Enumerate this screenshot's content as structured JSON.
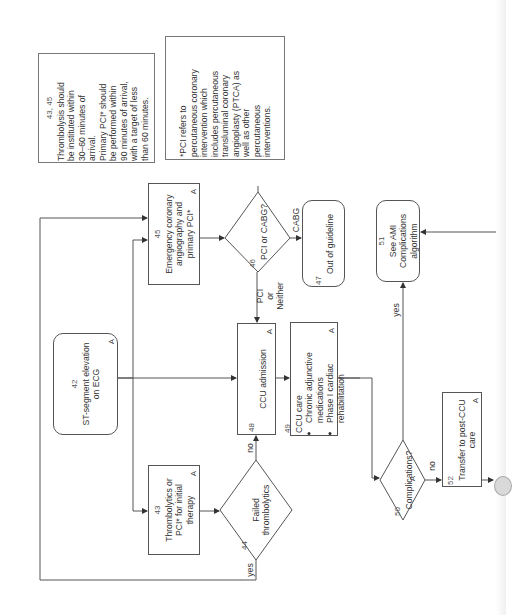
{
  "diagram": {
    "orientation": "rotated-90-ccw",
    "notes": {
      "timing": {
        "ref": "43, 45",
        "lines": [
          "Thrombolysis should",
          "be instituted within",
          "30–60 minutes of",
          "arrival.",
          "Primary PCI* should",
          "be performed within",
          "90 minutes of arrival,",
          "with a target of less",
          "than 60 minutes."
        ]
      },
      "pci_definition": {
        "lines": [
          "*PCI refers to",
          "percutaneous coronary",
          "intervention which",
          "includes percutaneous",
          "transluminal coronary",
          "angioplasty (PTCA) as",
          "well as other",
          "percutaneous",
          "interventions."
        ]
      }
    },
    "nodes": {
      "n42": {
        "num": "42",
        "text1": "ST-segment elevation",
        "text2": "on ECG",
        "tag": "A",
        "shape": "rounded"
      },
      "n43": {
        "num": "43",
        "text1": "Thrombolytics or",
        "text2": "PCI* for initial",
        "text3": "therapy",
        "tag": "A",
        "shape": "box"
      },
      "n44": {
        "num": "44",
        "text1": "Failed",
        "text2": "thrombolytics",
        "shape": "diamond"
      },
      "n45": {
        "num": "45",
        "text1": "Emergency coronary",
        "text2": "angiography and",
        "text3": "primary PCI*",
        "tag": "A",
        "shape": "box"
      },
      "n46": {
        "num": "46",
        "text1": "PCI or CABG?",
        "shape": "diamond"
      },
      "n47": {
        "num": "47",
        "text1": "Out of guideline",
        "shape": "rounded"
      },
      "n48": {
        "num": "48",
        "text1": "CCU admission",
        "tag": "A",
        "shape": "box"
      },
      "n49": {
        "num": "49",
        "title": "CCU care",
        "bullets": [
          "Chronic adjunctive medications",
          "Phase I cardiac rehabilitation"
        ],
        "bullet_lines": [
          [
            "Chronic adjunctive",
            "medications"
          ],
          [
            "Phase I cardiac",
            "rehabilitation"
          ]
        ],
        "tag": "A",
        "shape": "box"
      },
      "n50": {
        "num": "50",
        "text1": "Complications?",
        "tag": "A",
        "shape": "diamond"
      },
      "n51": {
        "num": "51",
        "text1": "See AMI",
        "text2": "Complications",
        "text3": "algorithm",
        "shape": "rounded"
      },
      "n52": {
        "num": "52",
        "text1": "Transfer to post-CCU",
        "text2": "care",
        "tag": "A",
        "shape": "box"
      }
    },
    "edge_labels": {
      "cabg": "CABG",
      "pci_or_neither_1": "PCI",
      "pci_or_neither_2": "or",
      "pci_or_neither_3": "Neither",
      "no_44": "no",
      "yes_44": "yes",
      "yes_50": "yes",
      "no_50": "no"
    },
    "colors": {
      "line": "#555555",
      "text": "#333333",
      "background": "#ffffff"
    }
  }
}
